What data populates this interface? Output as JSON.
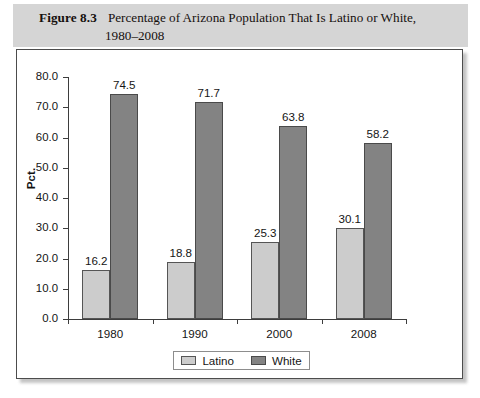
{
  "figure": {
    "number_label": "Figure 8.3",
    "caption_line1": "Percentage of Arizona Population That Is Latino or White,",
    "caption_line2": "1980–2008"
  },
  "chart_data": {
    "type": "bar",
    "title": "Percentage of Arizona Population That Is Latino or White, 1980–2008",
    "xlabel": "",
    "ylabel": "Pct.",
    "categories": [
      "1980",
      "1990",
      "2000",
      "2008"
    ],
    "series": [
      {
        "name": "Latino",
        "color": "#cccccc",
        "values": [
          16.2,
          18.8,
          25.3,
          30.1
        ]
      },
      {
        "name": "White",
        "color": "#838383",
        "values": [
          74.5,
          71.7,
          63.8,
          58.2
        ]
      }
    ],
    "ylim": [
      0.0,
      80.0
    ],
    "ytick_step": 10.0,
    "ytick_labels": [
      "0.0",
      "10.0",
      "20.0",
      "30.0",
      "40.0",
      "50.0",
      "60.0",
      "70.0",
      "80.0"
    ],
    "value_labels": {
      "Latino": [
        "16.2",
        "18.8",
        "25.3",
        "30.1"
      ],
      "White": [
        "74.5",
        "71.7",
        "63.8",
        "58.2"
      ]
    },
    "grid": false,
    "legend_position": "bottom-center",
    "legend_entries": [
      "Latino",
      "White"
    ]
  }
}
